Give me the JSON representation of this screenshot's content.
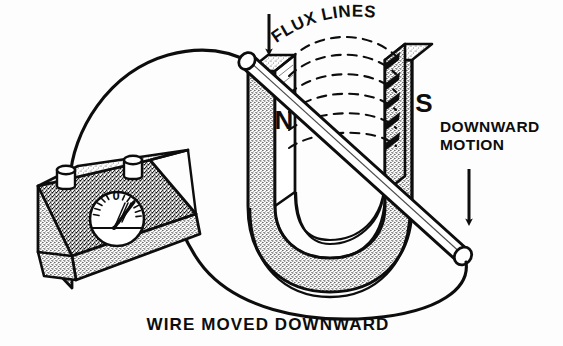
{
  "figure": {
    "background_color": "#fdfdfd",
    "ink_color": "#0d0d0d"
  },
  "labels": {
    "flux_lines": "FLUX LINES",
    "pole_north": "N",
    "pole_south": "S",
    "downward_motion_line1": "DOWNWARD",
    "downward_motion_line2": "MOTION",
    "caption": "WIRE MOVED DOWNWARD",
    "meter_zero": "0"
  },
  "components": {
    "galvanometer": {
      "name": "galvanometer",
      "dial_zero_mark": "0",
      "needle_deflection": "right",
      "terminal_count": 2
    },
    "magnet": {
      "name": "horseshoe-magnet",
      "shape": "U",
      "north_pole": "N",
      "south_pole": "S"
    },
    "conductor": {
      "name": "wire-rod",
      "motion": "downward"
    },
    "flux": {
      "name": "flux-lines",
      "arc_count": 6,
      "style": "dashed",
      "direction": "north-to-south"
    }
  },
  "arrows": {
    "flux_pointer": "down",
    "motion_pointer": "down"
  }
}
